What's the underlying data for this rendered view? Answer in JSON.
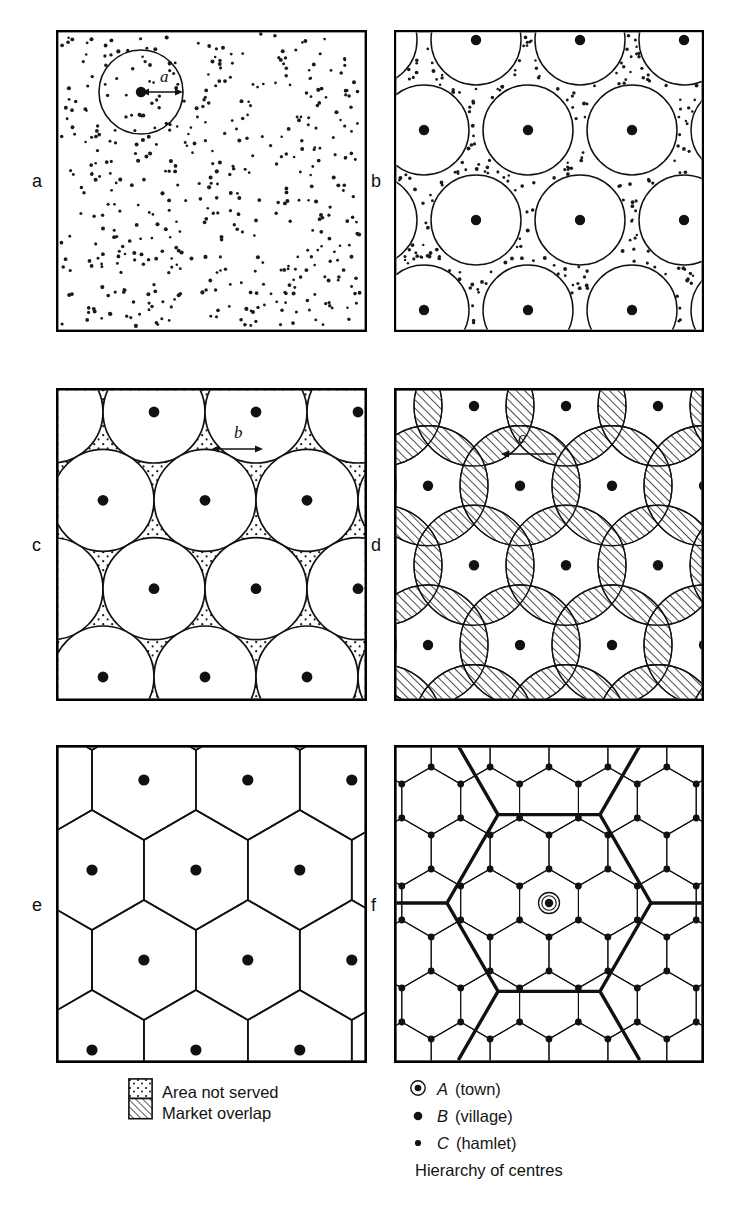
{
  "figure": {
    "title_present": false,
    "panels": [
      {
        "id": "a",
        "label": "a",
        "caption_text": "",
        "inner_label": "a",
        "description": "randomly scattered population dots with one service circle of radius a"
      },
      {
        "id": "b",
        "label": "b",
        "inner_label": "",
        "description": "regular lattice of separate non-touching market circles over scattered population"
      },
      {
        "id": "c",
        "label": "c",
        "inner_label": "b",
        "description": "tangent circles of radius b with dotted unserved interstices"
      },
      {
        "id": "d",
        "label": "d",
        "inner_label": "c",
        "description": "overlapping circles of radius c with hatched market overlap lenses"
      },
      {
        "id": "e",
        "label": "e",
        "inner_label": "",
        "description": "hexagonal market areas tessellating the plane"
      },
      {
        "id": "f",
        "label": "f",
        "inner_label": "",
        "description": "hierarchy of centres: town, village and hamlet hexagon nets"
      }
    ]
  },
  "legend_left": {
    "items": [
      {
        "swatch": "dotted-swatch",
        "label": "Area not served"
      },
      {
        "swatch": "hatched-swatch",
        "label": "Market overlap"
      }
    ]
  },
  "legend_right": {
    "items": [
      {
        "symbol": "circled-dot-icon",
        "code": "A",
        "name": "(town)"
      },
      {
        "symbol": "medium-dot-icon",
        "code": "B",
        "name": "(village)"
      },
      {
        "symbol": "small-dot-icon",
        "code": "C",
        "name": "(hamlet)"
      }
    ],
    "caption": "Hierarchy of centres"
  },
  "colors": {
    "ink": "#151515",
    "paper": "#ffffff",
    "rule": "#000000"
  },
  "chart_data": {
    "type": "diagram",
    "panels": [
      "a",
      "b",
      "c",
      "d",
      "e",
      "f"
    ],
    "radius_labels": [
      "a",
      "b",
      "c"
    ],
    "hierarchy": [
      "A (town)",
      "B (village)",
      "C (hamlet)"
    ]
  }
}
